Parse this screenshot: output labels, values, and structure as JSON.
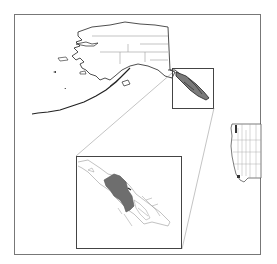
{
  "map": {
    "type": "locator-map",
    "regions": [
      "Alaska",
      "Southeast Alaska inset",
      "Western contiguous United States"
    ],
    "colors": {
      "frame": "#777777",
      "outline": "#222222",
      "boundary": "#9a9a9a",
      "highlight": "#6e6e6e",
      "background": "#ffffff"
    }
  }
}
